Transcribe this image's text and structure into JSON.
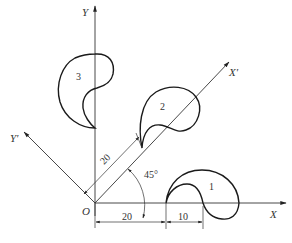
{
  "figure": {
    "axes": {
      "x_label": "X",
      "y_label": "Y",
      "x_prime_label": "X′",
      "y_prime_label": "Y′",
      "origin_label": "O"
    },
    "shapes": [
      {
        "id": "1",
        "label": "1"
      },
      {
        "id": "2",
        "label": "2"
      },
      {
        "id": "3",
        "label": "3"
      }
    ],
    "dimensions": {
      "origin_to_shape1_x": "20",
      "shape1_width": "10",
      "offset_along_x_prime": "20",
      "rotation_angle": "45°"
    }
  }
}
